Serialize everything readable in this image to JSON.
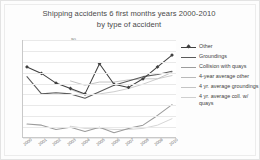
{
  "chart_data": {
    "type": "line",
    "title": "Shipping accidents 6 first months years 2000-2010 by type of accident",
    "title_line1": "Shipping accidents 6 first months years 2000-2010",
    "title_line2": "by type of accident",
    "xlabel": "",
    "ylabel": "",
    "ylim": [
      0,
      90
    ],
    "yticks": [
      "0",
      "10",
      "20",
      "30",
      "40",
      "50",
      "60",
      "70",
      "80",
      "90"
    ],
    "grid": true,
    "legend_position": "right",
    "categories": [
      "2000",
      "2001",
      "2002",
      "2003",
      "2004",
      "2005",
      "2006",
      "2007",
      "2008",
      "2009",
      "2010"
    ],
    "series": [
      {
        "name": "Other",
        "color": "#404040",
        "marker": "diamond",
        "values": [
          65,
          59,
          50,
          45,
          40,
          68,
          49,
          46,
          54,
          65,
          76
        ]
      },
      {
        "name": "Groundings",
        "color": "#5a5a5a",
        "marker": "none",
        "values": [
          56,
          40,
          41,
          40,
          36,
          42,
          48,
          52,
          56,
          58,
          61
        ]
      },
      {
        "name": "Collision with quays",
        "color": "#9c9c9c",
        "marker": "none",
        "values": [
          12,
          11,
          7,
          9,
          5,
          9,
          4,
          8,
          11,
          20,
          30
        ]
      },
      {
        "name": "4-year average other",
        "color": "#b9b9b9",
        "marker": "none",
        "values": [
          null,
          null,
          null,
          52,
          48,
          51,
          51,
          53,
          54,
          54,
          60
        ]
      },
      {
        "name": "4 yr. average groundings",
        "color": "#c4c4c4",
        "marker": "none",
        "values": [
          null,
          null,
          null,
          44,
          39,
          40,
          42,
          45,
          49,
          54,
          57
        ]
      },
      {
        "name": "4 yr. average coll. w/ quays",
        "color": "#cfcfcf",
        "marker": "none",
        "values": [
          null,
          null,
          null,
          10,
          8,
          8,
          7,
          7,
          8,
          11,
          17
        ]
      }
    ]
  },
  "legend": {
    "items": [
      {
        "label": "Other"
      },
      {
        "label": "Groundings"
      },
      {
        "label": "Collision with quays"
      },
      {
        "label": "4-year average other"
      },
      {
        "label": "4 yr. average groundings"
      },
      {
        "label": "4 yr. average coll. w/ quays"
      }
    ]
  }
}
